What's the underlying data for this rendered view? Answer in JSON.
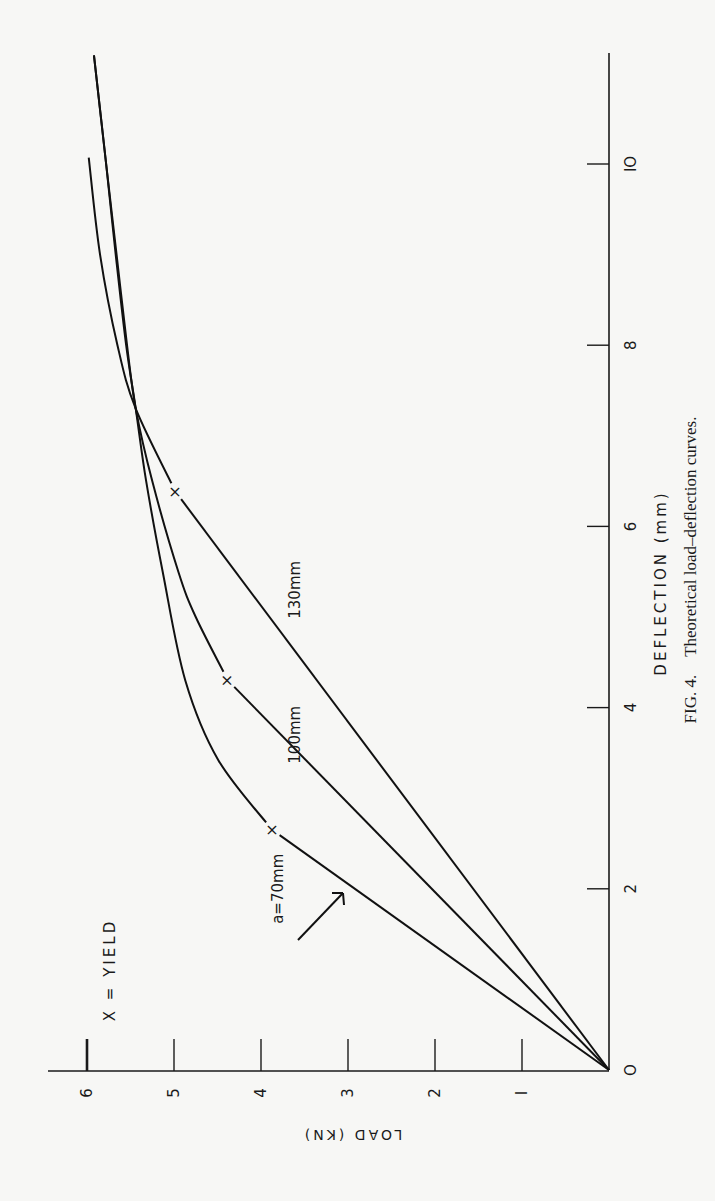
{
  "figure": {
    "caption_prefix": "FIG. 4.",
    "caption_text": "Theoretical load–deflection curves.",
    "legend": "X = YIELD",
    "orientation": "rotated 90° counter-clockwise on page"
  },
  "chart_data": {
    "type": "line",
    "title": "Theoretical load–deflection curves.",
    "xlabel": "DEFLECTION (mm)",
    "ylabel": "LOAD (KN)",
    "xlim": [
      0,
      11.2
    ],
    "ylim": [
      0,
      6
    ],
    "x_ticks": [
      0,
      2,
      4,
      6,
      8,
      10
    ],
    "y_ticks": [
      0,
      1,
      2,
      3,
      4,
      5,
      6
    ],
    "grid": false,
    "legend_note": "X = YIELD",
    "series": [
      {
        "name": "a=70mm",
        "points": [
          [
            0,
            0
          ],
          [
            2.65,
            3.87
          ],
          [
            3.42,
            4.49
          ],
          [
            4.3,
            4.87
          ],
          [
            5.5,
            5.13
          ],
          [
            6.5,
            5.32
          ],
          [
            7.3,
            5.44
          ],
          [
            8.0,
            5.55
          ],
          [
            9.0,
            5.67
          ],
          [
            10.0,
            5.78
          ],
          [
            11.2,
            5.92
          ]
        ],
        "yield": [
          2.65,
          3.87
        ],
        "label_pos": [
          2.0,
          3.8
        ]
      },
      {
        "name": "100mm",
        "points": [
          [
            0,
            0
          ],
          [
            4.3,
            4.38
          ],
          [
            5.0,
            4.75
          ],
          [
            5.5,
            4.95
          ],
          [
            6.5,
            5.25
          ],
          [
            7.3,
            5.44
          ],
          [
            8.0,
            5.54
          ],
          [
            9.0,
            5.66
          ],
          [
            10.0,
            5.78
          ],
          [
            11.2,
            5.92
          ]
        ],
        "yield": [
          4.3,
          4.38
        ],
        "label_pos": [
          3.7,
          3.6
        ]
      },
      {
        "name": "130mm",
        "points": [
          [
            0,
            0
          ],
          [
            6.38,
            4.98
          ],
          [
            7.3,
            5.44
          ],
          [
            8.0,
            5.65
          ],
          [
            9.0,
            5.85
          ],
          [
            10.07,
            5.98
          ]
        ],
        "yield": [
          6.38,
          4.98
        ],
        "label_pos": [
          5.3,
          3.6
        ]
      }
    ]
  },
  "axes": {
    "x_tick_labels": [
      "O",
      "2",
      "4",
      "6",
      "8",
      "IO"
    ],
    "y_tick_labels": [
      "O",
      "I",
      "2",
      "3",
      "4",
      "5",
      "6"
    ]
  }
}
